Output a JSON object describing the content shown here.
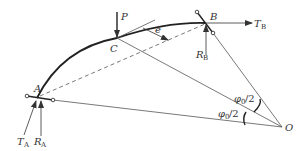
{
  "diagram": {
    "type": "arch-with-concentrated-load",
    "labels": {
      "A": "A",
      "B": "B",
      "C": "C",
      "O": "O",
      "P": "P",
      "e": "e",
      "T": "T",
      "R": "R",
      "sub_A": "A",
      "sub_B": "B",
      "phi_half_upper": "φ0/2",
      "phi_half_lower": "φ0/2",
      "phi": "φ",
      "phi_sub": "0",
      "half": "/2"
    },
    "points": {
      "A": [
        37,
        98
      ],
      "B": [
        205,
        23
      ],
      "C": [
        117,
        38
      ],
      "O": [
        282,
        127
      ]
    },
    "colors": {
      "line": "#444444",
      "text": "#333333",
      "background": "#ffffff"
    }
  }
}
